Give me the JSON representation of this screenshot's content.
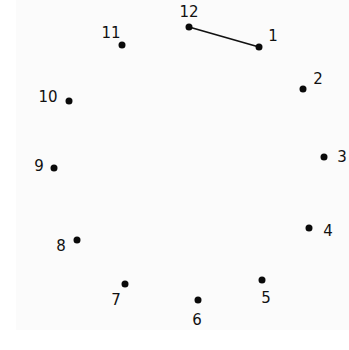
{
  "puzzle": {
    "type": "connect-the-dots clock",
    "line_color": "#111111",
    "dot_color": "#0a0a0a",
    "connected_segments": [
      [
        "12",
        "1"
      ]
    ],
    "points": [
      {
        "label": "12",
        "dot": [
          189,
          27
        ],
        "text": [
          189,
          12
        ]
      },
      {
        "label": "1",
        "dot": [
          259,
          47
        ],
        "text": [
          273,
          36
        ]
      },
      {
        "label": "2",
        "dot": [
          303,
          89
        ],
        "text": [
          318,
          79
        ]
      },
      {
        "label": "3",
        "dot": [
          324,
          157
        ],
        "text": [
          342,
          157
        ]
      },
      {
        "label": "4",
        "dot": [
          309,
          228
        ],
        "text": [
          328,
          231
        ]
      },
      {
        "label": "5",
        "dot": [
          262,
          280
        ],
        "text": [
          266,
          298
        ]
      },
      {
        "label": "6",
        "dot": [
          198,
          300
        ],
        "text": [
          197,
          320
        ]
      },
      {
        "label": "7",
        "dot": [
          125,
          284
        ],
        "text": [
          116,
          300
        ]
      },
      {
        "label": "8",
        "dot": [
          77,
          240
        ],
        "text": [
          61,
          246
        ]
      },
      {
        "label": "9",
        "dot": [
          54,
          168
        ],
        "text": [
          39,
          166
        ]
      },
      {
        "label": "10",
        "dot": [
          69,
          101
        ],
        "text": [
          48,
          97
        ]
      },
      {
        "label": "11",
        "dot": [
          122,
          45
        ],
        "text": [
          111,
          33
        ]
      }
    ]
  }
}
